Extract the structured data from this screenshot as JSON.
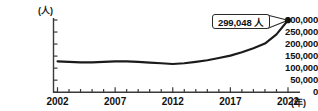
{
  "title": {
    "text": "",
    "clipped": true
  },
  "chart_data": {
    "type": "line",
    "title": "",
    "xlabel": "年",
    "ylabel": "人",
    "x_unit_label": "(年)",
    "y_unit_label": "(人)",
    "grid": false,
    "legend": "none",
    "xlim": [
      2002,
      2022
    ],
    "ylim": [
      0,
      300000
    ],
    "y_ticks": [
      0,
      50000,
      100000,
      150000,
      200000,
      250000,
      300000
    ],
    "y_tick_labels": [
      "0",
      "50,000",
      "100,000",
      "150,000",
      "200,000",
      "250,000",
      "300,000"
    ],
    "x_ticks": [
      2002,
      2003,
      2004,
      2005,
      2006,
      2007,
      2008,
      2009,
      2010,
      2011,
      2012,
      2013,
      2014,
      2015,
      2016,
      2017,
      2018,
      2019,
      2020,
      2021,
      2022
    ],
    "x_tick_labels_shown": [
      "2002",
      "2007",
      "2012",
      "2017",
      "2022"
    ],
    "x": [
      2002,
      2003,
      2004,
      2005,
      2006,
      2007,
      2008,
      2009,
      2010,
      2011,
      2012,
      2013,
      2014,
      2015,
      2016,
      2017,
      2018,
      2019,
      2020,
      2021,
      2022
    ],
    "values": [
      128000,
      126000,
      124000,
      124000,
      126000,
      128000,
      128000,
      126000,
      123000,
      120000,
      117000,
      120000,
      126000,
      133000,
      142000,
      152000,
      166000,
      183000,
      202000,
      240000,
      299048
    ],
    "series": [
      {
        "name": "人数",
        "color": "#1a1a1a",
        "values": [
          128000,
          126000,
          124000,
          124000,
          126000,
          128000,
          128000,
          126000,
          123000,
          120000,
          117000,
          120000,
          126000,
          133000,
          142000,
          152000,
          166000,
          183000,
          202000,
          240000,
          299048
        ]
      }
    ],
    "annotations": [
      {
        "label": "299,048 人",
        "x": 2022,
        "y": 299048,
        "marker": "dot"
      }
    ]
  },
  "colors": {
    "line": "#1a1a1a",
    "axis": "#3a3a3a",
    "text": "#111111",
    "callout_border": "#2a2a2a",
    "callout_fill": "#ffffff",
    "background": "#ffffff"
  }
}
